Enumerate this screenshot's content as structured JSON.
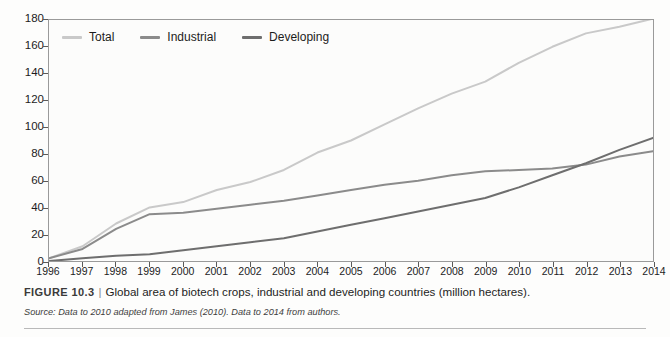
{
  "chart_data": {
    "type": "line",
    "title": "",
    "xlabel": "",
    "ylabel": "",
    "ylim": [
      0,
      180
    ],
    "ytick_step": 20,
    "grid": false,
    "legend_position": "top-left-inside",
    "x": [
      1996,
      1997,
      1998,
      1999,
      2000,
      2001,
      2002,
      2003,
      2004,
      2005,
      2006,
      2007,
      2008,
      2009,
      2010,
      2011,
      2012,
      2013,
      2014
    ],
    "categories": [
      "1996",
      "1997",
      "1998",
      "1999",
      "2000",
      "2001",
      "2002",
      "2003",
      "2004",
      "2005",
      "2006",
      "2007",
      "2008",
      "2009",
      "2010",
      "2011",
      "2012",
      "2013",
      "2014"
    ],
    "yticks": [
      "0",
      "20",
      "40",
      "60",
      "80",
      "100",
      "120",
      "140",
      "160",
      "180"
    ],
    "series": [
      {
        "name": "Total",
        "color": "#c9c9c9",
        "values": [
          2,
          11,
          28,
          40,
          44,
          53,
          59,
          68,
          81,
          90,
          102,
          114,
          125,
          134,
          148,
          160,
          170,
          175,
          181
        ]
      },
      {
        "name": "Industrial",
        "color": "#8b8b8b",
        "values": [
          2,
          9,
          24,
          35,
          36,
          39,
          42,
          45,
          49,
          53,
          57,
          60,
          64,
          67,
          68,
          69,
          72,
          78,
          82
        ]
      },
      {
        "name": "Developing",
        "color": "#6e6e6e",
        "values": [
          0,
          2,
          4,
          5,
          8,
          11,
          14,
          17,
          22,
          27,
          32,
          37,
          42,
          47,
          55,
          64,
          73,
          83,
          92
        ]
      }
    ]
  },
  "legend": {
    "items": [
      {
        "label": "Total",
        "color": "#c9c9c9"
      },
      {
        "label": "Industrial",
        "color": "#8b8b8b"
      },
      {
        "label": "Developing",
        "color": "#6e6e6e"
      }
    ]
  },
  "caption": {
    "figure_number": "FIGURE 10.3",
    "separator": "|",
    "text": "Global area of biotech crops, industrial and developing countries (million hectares).",
    "source": "Source: Data to 2010 adapted from James (2010). Data to 2014 from authors."
  }
}
